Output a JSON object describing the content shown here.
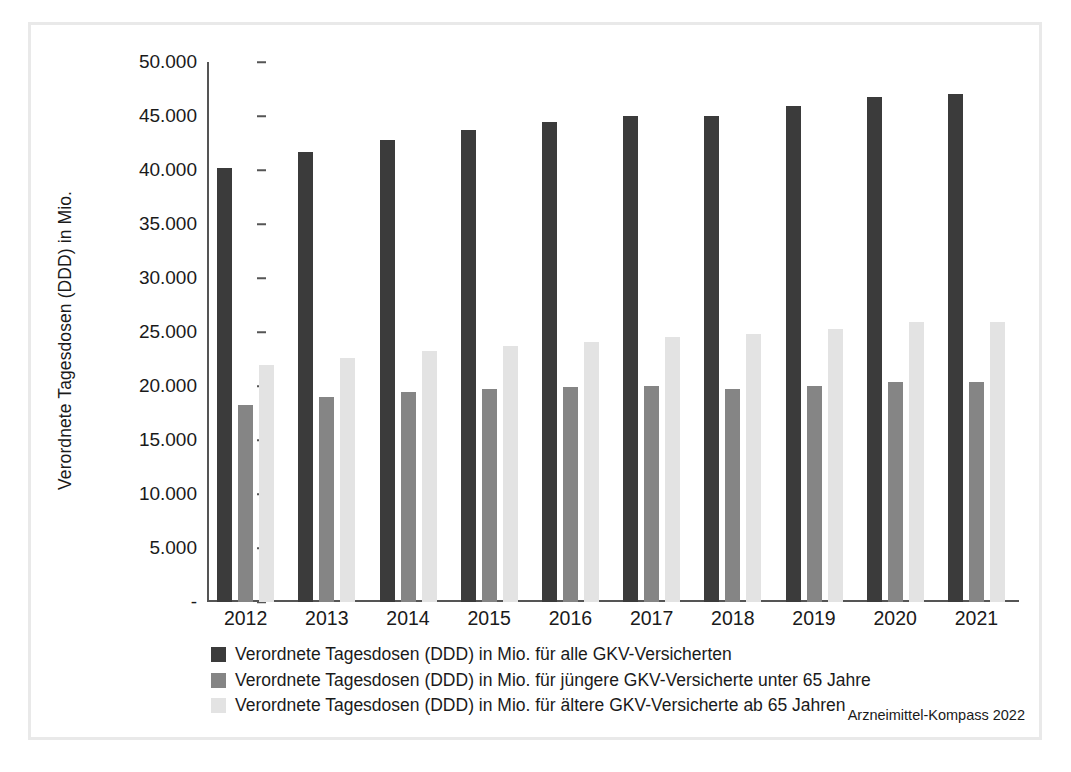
{
  "chart_data": {
    "type": "bar",
    "title": "",
    "xlabel": "",
    "ylabel": "Verordnete Tagesdosen (DDD) in Mio.",
    "categories": [
      "2012",
      "2013",
      "2014",
      "2015",
      "2016",
      "2017",
      "2018",
      "2019",
      "2020",
      "2021"
    ],
    "series": [
      {
        "name": "Verordnete Tagesdosen (DDD) in Mio. für alle GKV-Versicherten",
        "color": "#3b3b3b",
        "values": [
          40200,
          41700,
          42800,
          43700,
          44400,
          45000,
          45000,
          45900,
          46800,
          47000
        ]
      },
      {
        "name": "Verordnete Tagesdosen (DDD) in Mio. für jüngere GKV-Versicherte unter 65 Jahre",
        "color": "#858585",
        "values": [
          18200,
          19000,
          19400,
          19700,
          19900,
          20000,
          19700,
          20000,
          20400,
          20400
        ]
      },
      {
        "name": "Verordnete Tagesdosen (DDD) in Mio. für ältere GKV-Versicherte ab 65 Jahren",
        "color": "#e3e3e3",
        "values": [
          21900,
          22600,
          23200,
          23700,
          24100,
          24500,
          24800,
          25300,
          25900,
          25900
        ]
      }
    ],
    "ylim": [
      0,
      50000
    ],
    "y_ticks": [
      0,
      5000,
      10000,
      15000,
      20000,
      25000,
      30000,
      35000,
      40000,
      45000,
      50000
    ],
    "y_tick_labels": [
      "-",
      "5.000",
      "10.000",
      "15.000",
      "20.000",
      "25.000",
      "30.000",
      "35.000",
      "40.000",
      "45.000",
      "50.000"
    ],
    "grid": false,
    "legend_position": "bottom-left"
  },
  "legend": {
    "items": [
      {
        "label": "Verordnete Tagesdosen (DDD) in Mio. für alle GKV-Versicherten",
        "swatch": "dark-swatch"
      },
      {
        "label": "Verordnete Tagesdosen (DDD) in Mio. für jüngere GKV-Versicherte unter 65 Jahre",
        "swatch": "medium-swatch"
      },
      {
        "label": "Verordnete Tagesdosen (DDD) in Mio. für ältere GKV-Versicherte ab 65 Jahren",
        "swatch": "light-swatch"
      }
    ]
  },
  "source": {
    "text": "Arzneimittel-Kompass 2022"
  }
}
